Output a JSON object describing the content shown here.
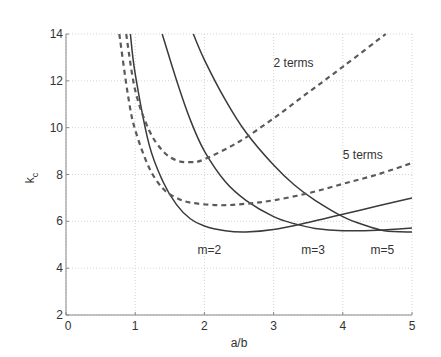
{
  "chart_data": {
    "type": "line",
    "title": "",
    "xlabel": "a/b",
    "ylabel": "k_c",
    "ylabel_main": "k",
    "ylabel_sub": "c",
    "xlim": [
      0,
      5
    ],
    "ylim": [
      2,
      14
    ],
    "xticks": [
      0,
      1,
      2,
      3,
      4,
      5
    ],
    "yticks": [
      2,
      4,
      6,
      8,
      10,
      12,
      14
    ],
    "grid": true,
    "legend": null,
    "series": [
      {
        "name": "m=2",
        "style": "solid",
        "x": [
          0.93,
          1.0,
          1.2,
          1.4,
          1.6,
          1.8,
          2.0,
          2.3,
          2.6,
          3.0,
          3.5,
          4.0,
          4.5,
          5.0
        ],
        "y": [
          14.0,
          12.3,
          9.3,
          7.7,
          6.7,
          6.1,
          5.8,
          5.6,
          5.55,
          5.65,
          5.95,
          6.3,
          6.65,
          7.0
        ]
      },
      {
        "name": "m=3",
        "style": "solid",
        "x": [
          1.39,
          1.6,
          1.8,
          2.0,
          2.3,
          2.6,
          3.0,
          3.3,
          3.6,
          4.0,
          4.5,
          5.0
        ],
        "y": [
          14.0,
          12.0,
          10.3,
          9.0,
          7.7,
          6.9,
          6.2,
          5.9,
          5.7,
          5.6,
          5.62,
          5.71
        ]
      },
      {
        "name": "m=5",
        "style": "solid",
        "x": [
          1.84,
          2.0,
          2.3,
          2.6,
          3.0,
          3.3,
          3.6,
          4.0,
          4.3,
          4.6,
          5.0
        ],
        "y": [
          14.0,
          12.9,
          11.2,
          9.8,
          8.4,
          7.55,
          6.9,
          6.2,
          5.85,
          5.6,
          5.54
        ]
      },
      {
        "name": "2 terms",
        "style": "dashed",
        "x": [
          0.87,
          1.0,
          1.2,
          1.4,
          1.6,
          1.8,
          2.0,
          2.5,
          3.0,
          3.5,
          4.0,
          4.62
        ],
        "y": [
          14.0,
          11.6,
          9.9,
          9.0,
          8.6,
          8.53,
          8.65,
          9.4,
          10.4,
          11.5,
          12.6,
          14.0
        ]
      },
      {
        "name": "5 terms",
        "style": "dashed",
        "x": [
          0.77,
          0.9,
          1.0,
          1.2,
          1.4,
          1.6,
          1.8,
          2.2,
          2.6,
          3.0,
          3.5,
          4.0,
          4.5,
          5.0
        ],
        "y": [
          14.0,
          11.3,
          9.9,
          8.3,
          7.4,
          7.0,
          6.8,
          6.69,
          6.75,
          6.9,
          7.2,
          7.6,
          8.0,
          8.49
        ]
      }
    ],
    "annotations": [
      {
        "text": "2 terms",
        "x": 3.0,
        "y": 12.6
      },
      {
        "text": "5 terms",
        "x": 4.0,
        "y": 8.65
      },
      {
        "text": "m=2",
        "x": 1.9,
        "y": 4.6
      },
      {
        "text": "m=3",
        "x": 3.4,
        "y": 4.6
      },
      {
        "text": "m=5",
        "x": 4.4,
        "y": 4.6
      }
    ]
  }
}
